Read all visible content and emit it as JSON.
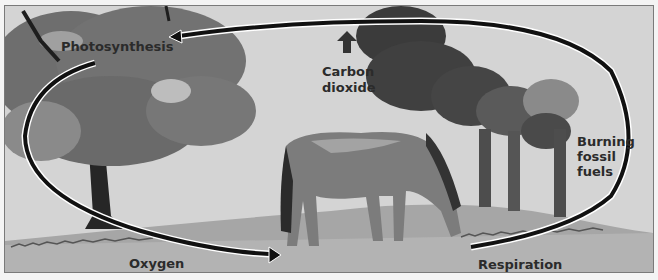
{
  "diagram": {
    "labels": {
      "photosynthesis": "Photosynthesis",
      "carbon_dioxide_line1": "Carbon",
      "carbon_dioxide_line2": "dioxide",
      "burning_line1": "Burning",
      "burning_line2": "fossil",
      "burning_line3": "fuels",
      "oxygen": "Oxygen",
      "respiration": "Respiration"
    },
    "icons": {
      "carbon_dioxide_arrow": "arrow-up-icon",
      "cycle_arrow": "cycle-arrow-icon"
    },
    "colors": {
      "sky": "#d6d6d6",
      "ground": "#a9a9a9",
      "tree_foliage": "#6f6f6f",
      "smoke": "#3f3f3f",
      "horse": "#7d7d7d",
      "arrow": "#111111",
      "text": "#2b2b2b"
    }
  }
}
